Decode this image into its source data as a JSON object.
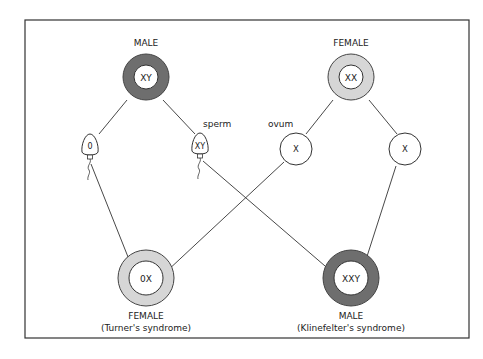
{
  "colors": {
    "frame": "#333333",
    "male_ring": "#6e6e6e",
    "female_ring": "#d6d6d6",
    "line": "#333333",
    "background": "#ffffff"
  },
  "parents": {
    "male": {
      "label": "MALE",
      "genotype": "XY"
    },
    "female": {
      "label": "FEMALE",
      "genotype": "XX"
    }
  },
  "gametes": {
    "sperm_label": "sperm",
    "ovum_label": "ovum",
    "sperm": [
      {
        "genotype": "0"
      },
      {
        "genotype": "XY"
      }
    ],
    "ova": [
      {
        "genotype": "X"
      },
      {
        "genotype": "X"
      }
    ]
  },
  "offspring": {
    "turner": {
      "label": "FEMALE",
      "genotype": "0X",
      "condition": "(Turner's syndrome)"
    },
    "klinefelter": {
      "label": "MALE",
      "genotype": "XXY",
      "condition": "(Klinefelter's syndrome)"
    }
  }
}
